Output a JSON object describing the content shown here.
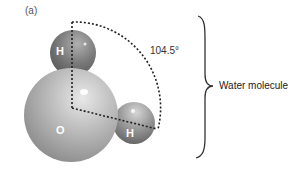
{
  "figure": {
    "panel_label": "(a)",
    "angle_label": "104.5°",
    "brace_label": "Water molecule",
    "atoms": [
      {
        "symbol": "H",
        "role": "hydrogen-top"
      },
      {
        "symbol": "O",
        "role": "oxygen"
      },
      {
        "symbol": "H",
        "role": "hydrogen-right"
      }
    ],
    "colors": {
      "oxygen": "#b8b8b8",
      "hydrogen": "#7a7a7a",
      "dashed_line": "#222222",
      "brace": "#333333"
    }
  }
}
